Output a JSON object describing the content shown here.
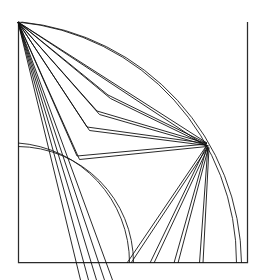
{
  "figure": {
    "title": "Quarter-annulus geodesic fan diagram",
    "type": "line-diagram",
    "background_color": "#ffffff",
    "stroke_color": "#1a1a1a",
    "frame_color": "#2b2b2b",
    "canvas": {
      "width": 264,
      "height": 280
    }
  },
  "geometry": {
    "apex": {
      "label": "apex-vertex",
      "x": 18,
      "y": 22
    },
    "hub": {
      "label": "hub-vertex",
      "x": 207,
      "y": 144
    },
    "frame": {
      "label": "bounding-frame",
      "left_x": 18,
      "top_y": 22,
      "right_x": 248,
      "bottom_y": 263,
      "path": "M 18 22 L 18 263 L 248 263 L 248 22"
    },
    "outer_arc": {
      "label": "outer-quarter-arc",
      "start": {
        "x": 18,
        "y": 22
      },
      "end": {
        "x": 240,
        "y": 263
      },
      "center": {
        "x": 18,
        "y": 263
      },
      "radius": 241,
      "double_line_offset": 3.5
    },
    "inner_arc": {
      "label": "inner-quarter-arc",
      "start": {
        "x": 18,
        "y": 143
      },
      "end": {
        "x": 133,
        "y": 263
      },
      "center": {
        "x": 18,
        "y": 263
      },
      "radius": 120,
      "double_line_offset": 3.5
    },
    "apex_fan": {
      "label": "apex-fan-rays",
      "origin": {
        "x": 18,
        "y": 22
      },
      "count": 7,
      "targets": [
        {
          "x": 207,
          "y": 144,
          "name": "ray-to-hub-direct"
        },
        {
          "x": 207,
          "y": 143,
          "name": "ray-to-hub-upper"
        },
        {
          "x": 112,
          "y": 280,
          "name": "ray-steep-a"
        },
        {
          "x": 104,
          "y": 280,
          "name": "ray-steep-b"
        },
        {
          "x": 96,
          "y": 280,
          "name": "ray-steep-c"
        },
        {
          "x": 88,
          "y": 280,
          "name": "ray-steep-d"
        },
        {
          "x": 80,
          "y": 280,
          "name": "ray-steep-e"
        }
      ]
    },
    "chevrons": {
      "label": "nested-chevron-paths",
      "count": 4,
      "paths": [
        {
          "name": "chevron-1",
          "apex": {
            "x": 18,
            "y": 22
          },
          "bend": {
            "x": 108,
            "y": 95
          },
          "hub": {
            "x": 207,
            "y": 144
          }
        },
        {
          "name": "chevron-2",
          "apex": {
            "x": 18,
            "y": 22
          },
          "bend": {
            "x": 97,
            "y": 111
          },
          "hub": {
            "x": 207,
            "y": 144
          }
        },
        {
          "name": "chevron-3",
          "apex": {
            "x": 18,
            "y": 22
          },
          "bend": {
            "x": 87,
            "y": 127
          },
          "hub": {
            "x": 207,
            "y": 144
          }
        },
        {
          "name": "chevron-4",
          "apex": {
            "x": 18,
            "y": 22
          },
          "bend": {
            "x": 77,
            "y": 156
          },
          "hub": {
            "x": 207,
            "y": 144
          }
        }
      ],
      "double_line_offset": 3.0
    },
    "hub_fan": {
      "label": "hub-fan-rays-downward",
      "origin": {
        "x": 207,
        "y": 144
      },
      "count": 4,
      "targets": [
        {
          "x": 129,
          "y": 263,
          "name": "hub-ray-1"
        },
        {
          "x": 152,
          "y": 263,
          "name": "hub-ray-2"
        },
        {
          "x": 176,
          "y": 263,
          "name": "hub-ray-3"
        },
        {
          "x": 201,
          "y": 263,
          "name": "hub-ray-4"
        }
      ],
      "double_line_offset": 3.0
    }
  },
  "legend": {
    "visible": false,
    "entries": []
  }
}
